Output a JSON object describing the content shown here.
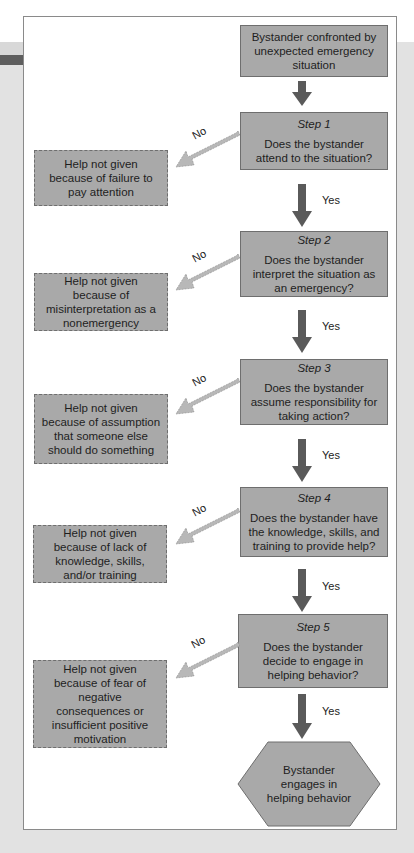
{
  "diagram": {
    "start": {
      "text": "Bystander confronted by unexpected emergency situation"
    },
    "steps": [
      {
        "label": "Step 1",
        "question": "Does the bystander attend to the situation?",
        "yes": "Yes",
        "no": "No",
        "no_outcome": "Help not given because of failure to pay attention"
      },
      {
        "label": "Step 2",
        "question": "Does the bystander interpret the situation as an emergency?",
        "yes": "Yes",
        "no": "No",
        "no_outcome": "Help not given because of misinterpretation as a nonemergency"
      },
      {
        "label": "Step 3",
        "question": "Does the bystander assume responsibility for taking action?",
        "yes": "Yes",
        "no": "No",
        "no_outcome": "Help not given because of assumption that someone else should do something"
      },
      {
        "label": "Step 4",
        "question": "Does the bystander have the knowledge, skills, and training to provide help?",
        "yes": "Yes",
        "no": "No",
        "no_outcome": "Help not given because of lack of knowledge, skills, and/or training"
      },
      {
        "label": "Step 5",
        "question": "Does the bystander decide to engage in helping behavior?",
        "yes": "Yes",
        "no": "No",
        "no_outcome": "Help not given because of fear of negative consequences or insufficient positive motivation"
      }
    ],
    "end": {
      "text": "Bystander engages in helping behavior"
    },
    "colors": {
      "box_fill": "#a9a9a9",
      "box_border": "#6e6e6e",
      "arrow_down": "#5a5a5a",
      "arrow_no": "#b8b8b8",
      "background": "#e2e2e2",
      "frame": "#ffffff"
    }
  }
}
